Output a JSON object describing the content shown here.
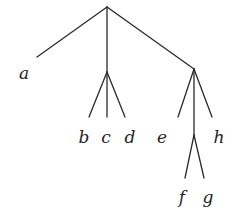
{
  "diagram": {
    "type": "tree",
    "nodes": [
      {
        "id": "root",
        "x": 107,
        "y": 7,
        "label": ""
      },
      {
        "id": "a",
        "x": 37,
        "y": 57,
        "label": "a",
        "lx": 24,
        "ly": 79
      },
      {
        "id": "mid",
        "x": 107,
        "y": 72,
        "label": ""
      },
      {
        "id": "b",
        "x": 89,
        "y": 117,
        "label": "b",
        "lx": 84,
        "ly": 143
      },
      {
        "id": "c",
        "x": 107,
        "y": 117,
        "label": "c",
        "lx": 106,
        "ly": 143
      },
      {
        "id": "d",
        "x": 125,
        "y": 117,
        "label": "d",
        "lx": 130,
        "ly": 143
      },
      {
        "id": "right",
        "x": 194,
        "y": 69,
        "label": ""
      },
      {
        "id": "e",
        "x": 178,
        "y": 117,
        "label": "e",
        "lx": 162,
        "ly": 143
      },
      {
        "id": "fg",
        "x": 194,
        "y": 135,
        "label": ""
      },
      {
        "id": "h",
        "x": 212,
        "y": 117,
        "label": "h",
        "lx": 219,
        "ly": 143
      },
      {
        "id": "f",
        "x": 185,
        "y": 178,
        "label": "f",
        "lx": 182,
        "ly": 203
      },
      {
        "id": "g",
        "x": 204,
        "y": 178,
        "label": "g",
        "lx": 208,
        "ly": 203
      }
    ],
    "edges": [
      [
        "root",
        "a"
      ],
      [
        "root",
        "mid"
      ],
      [
        "root",
        "right"
      ],
      [
        "mid",
        "b"
      ],
      [
        "mid",
        "c"
      ],
      [
        "mid",
        "d"
      ],
      [
        "right",
        "e"
      ],
      [
        "right",
        "fg"
      ],
      [
        "right",
        "h"
      ],
      [
        "fg",
        "f"
      ],
      [
        "fg",
        "g"
      ]
    ],
    "labels": {
      "a": "a",
      "b": "b",
      "c": "c",
      "d": "d",
      "e": "e",
      "f": "f",
      "g": "g",
      "h": "h"
    }
  }
}
